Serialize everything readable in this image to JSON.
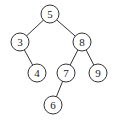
{
  "diagram": {
    "type": "binary-search-tree",
    "nodes": [
      {
        "id": "n5",
        "label": "5",
        "x": 50,
        "y": 14
      },
      {
        "id": "n3",
        "label": "3",
        "x": 20,
        "y": 42
      },
      {
        "id": "n8",
        "label": "8",
        "x": 82,
        "y": 42
      },
      {
        "id": "n4",
        "label": "4",
        "x": 37,
        "y": 73
      },
      {
        "id": "n7",
        "label": "7",
        "x": 66,
        "y": 73
      },
      {
        "id": "n9",
        "label": "9",
        "x": 98,
        "y": 73
      },
      {
        "id": "n6",
        "label": "6",
        "x": 53,
        "y": 105
      }
    ],
    "edges": [
      {
        "from": "n5",
        "to": "n3"
      },
      {
        "from": "n5",
        "to": "n8"
      },
      {
        "from": "n3",
        "to": "n4"
      },
      {
        "from": "n8",
        "to": "n7"
      },
      {
        "from": "n8",
        "to": "n9"
      },
      {
        "from": "n7",
        "to": "n6"
      }
    ]
  }
}
